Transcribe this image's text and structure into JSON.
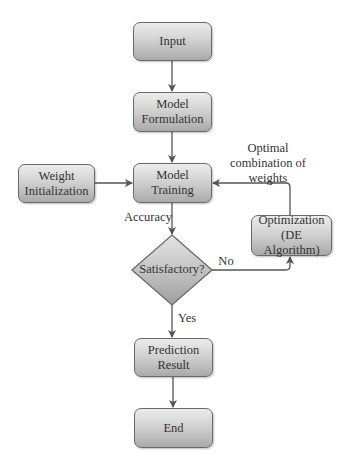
{
  "diagram": {
    "type": "flowchart",
    "nodes": {
      "input": {
        "label": "Input"
      },
      "model_formulation": {
        "label": "Model Formulation",
        "line1": "Model",
        "line2": "Formulation"
      },
      "weight_initialization": {
        "label": "Weight Initialization",
        "line1": "Weight",
        "line2": "Initialization"
      },
      "model_training": {
        "label": "Model Training"
      },
      "satisfactory": {
        "label": "Satisfactory?"
      },
      "optimization": {
        "label": "Optimization (DE Algorithm)",
        "line1": "Optimization",
        "line2": "(DE Algorithm)"
      },
      "prediction_result": {
        "label": "Prediction Result",
        "line1": "Prediction",
        "line2": "Result"
      },
      "end": {
        "label": "End"
      }
    },
    "edge_labels": {
      "accuracy": "Accuracy",
      "no": "No",
      "yes": "Yes",
      "optimal_line1": "Optimal",
      "optimal_line2": "combination of",
      "optimal_line3": "weights"
    },
    "edges": [
      {
        "from": "Input",
        "to": "Model Formulation"
      },
      {
        "from": "Model Formulation",
        "to": "Model Training"
      },
      {
        "from": "Weight Initialization",
        "to": "Model Training"
      },
      {
        "from": "Model Training",
        "to": "Satisfactory?",
        "label": "Accuracy"
      },
      {
        "from": "Satisfactory?",
        "to": "Optimization (DE Algorithm)",
        "label": "No"
      },
      {
        "from": "Optimization (DE Algorithm)",
        "to": "Model Training",
        "label": "Optimal combination of weights"
      },
      {
        "from": "Satisfactory?",
        "to": "Prediction Result",
        "label": "Yes"
      },
      {
        "from": "Prediction Result",
        "to": "End"
      }
    ],
    "colors": {
      "node_fill_top": "#ececec",
      "node_fill_bottom": "#aaaaaa",
      "node_border": "#6a6a6a",
      "connector": "#555555",
      "text": "#333333"
    }
  }
}
